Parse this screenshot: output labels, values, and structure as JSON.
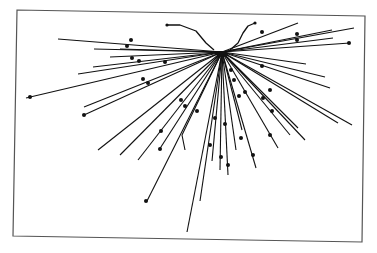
{
  "figure": {
    "ink_color": "#111111",
    "frame_color": "#555555",
    "background_color": "#ffffff",
    "hub": [
      222,
      52
    ],
    "arcs": [
      {
        "name": "left-arc",
        "points": [
          [
            167,
            25
          ],
          [
            180,
            25
          ],
          [
            196,
            31
          ],
          [
            206,
            43
          ],
          [
            214,
            50
          ]
        ]
      },
      {
        "name": "right-arc",
        "points": [
          [
            255,
            23
          ],
          [
            248,
            26
          ],
          [
            243,
            33
          ],
          [
            238,
            43
          ],
          [
            230,
            50
          ]
        ]
      }
    ],
    "rays": [
      {
        "end": [
          58,
          39
        ],
        "dots": [
          [
            131,
            40
          ]
        ]
      },
      {
        "end": [
          94,
          49
        ],
        "dots": [
          [
            127,
            46
          ]
        ]
      },
      {
        "end": [
          93,
          67
        ],
        "dots": [
          [
            132,
            58
          ]
        ]
      },
      {
        "end": [
          78,
          74
        ],
        "dots": [
          [
            139,
            61
          ],
          [
            165,
            62
          ]
        ]
      },
      {
        "end": [
          26,
          98
        ],
        "dots": [
          [
            30,
            97
          ]
        ]
      },
      {
        "end": [
          84,
          107
        ],
        "dots": [
          [
            143,
            79
          ]
        ]
      },
      {
        "end": [
          84,
          115
        ],
        "dots": [
          [
            84,
            115
          ],
          [
            148,
            83
          ]
        ]
      },
      {
        "end": [
          98,
          150
        ],
        "dots": []
      },
      {
        "end": [
          120,
          155
        ],
        "dots": [
          [
            161,
            131
          ]
        ]
      },
      {
        "end": [
          138,
          160
        ],
        "dots": [
          [
            181,
            100
          ]
        ]
      },
      {
        "end": [
          159,
          150
        ],
        "dots": [
          [
            160,
            149
          ],
          [
            185,
            106
          ]
        ]
      },
      {
        "end": [
          147,
          201
        ],
        "dots": [
          [
            146,
            201
          ],
          [
            197,
            111
          ]
        ]
      },
      {
        "end": [
          187,
          232
        ],
        "dots": []
      },
      {
        "end": [
          200,
          201
        ],
        "dots": []
      },
      {
        "end": [
          185,
          150
        ],
        "bend": [
          182,
          135
        ],
        "dots": []
      },
      {
        "end": [
          212,
          161
        ],
        "dots": [
          [
            210,
            145
          ],
          [
            215,
            118
          ]
        ]
      },
      {
        "end": [
          220,
          170
        ],
        "dots": [
          [
            221,
            157
          ],
          [
            225,
            124
          ]
        ]
      },
      {
        "end": [
          228,
          175
        ],
        "dots": [
          [
            228,
            165
          ]
        ]
      },
      {
        "end": [
          236,
          150
        ],
        "dots": [
          [
            241,
            138
          ]
        ]
      },
      {
        "end": [
          256,
          168
        ],
        "dots": [
          [
            253,
            155
          ],
          [
            239,
            96
          ]
        ]
      },
      {
        "end": [
          242,
          130
        ],
        "dots": [
          [
            231,
            70
          ],
          [
            234,
            80
          ]
        ]
      },
      {
        "end": [
          278,
          148
        ],
        "dots": [
          [
            270,
            135
          ],
          [
            245,
            92
          ]
        ]
      },
      {
        "end": [
          290,
          135
        ],
        "dots": [
          [
            263,
            98
          ]
        ]
      },
      {
        "end": [
          305,
          140
        ],
        "dots": [
          [
            272,
            111
          ]
        ]
      },
      {
        "end": [
          298,
          128
        ],
        "dots": []
      },
      {
        "end": [
          338,
          123
        ],
        "dots": []
      },
      {
        "end": [
          352,
          125
        ],
        "dots": [
          [
            270,
            90
          ]
        ]
      },
      {
        "end": [
          330,
          88
        ],
        "dots": [
          [
            262,
            66
          ]
        ]
      },
      {
        "end": [
          325,
          77
        ],
        "dots": []
      },
      {
        "end": [
          306,
          64
        ],
        "dots": []
      },
      {
        "end": [
          350,
          43
        ],
        "dots": [
          [
            349,
            43
          ]
        ]
      },
      {
        "end": [
          354,
          28
        ],
        "dots": []
      },
      {
        "end": [
          332,
          30
        ],
        "dots": [
          [
            297,
            34
          ]
        ]
      },
      {
        "end": [
          333,
          38
        ],
        "dots": [
          [
            297,
            40
          ]
        ]
      },
      {
        "end": [
          298,
          23
        ],
        "dots": [
          [
            262,
            32
          ]
        ]
      },
      {
        "end": [
          120,
          49
        ],
        "dots": []
      },
      {
        "end": [
          110,
          57
        ],
        "dots": []
      }
    ],
    "frame": [
      [
        17,
        10
      ],
      [
        365,
        16
      ],
      [
        362,
        242
      ],
      [
        13,
        236
      ]
    ]
  }
}
